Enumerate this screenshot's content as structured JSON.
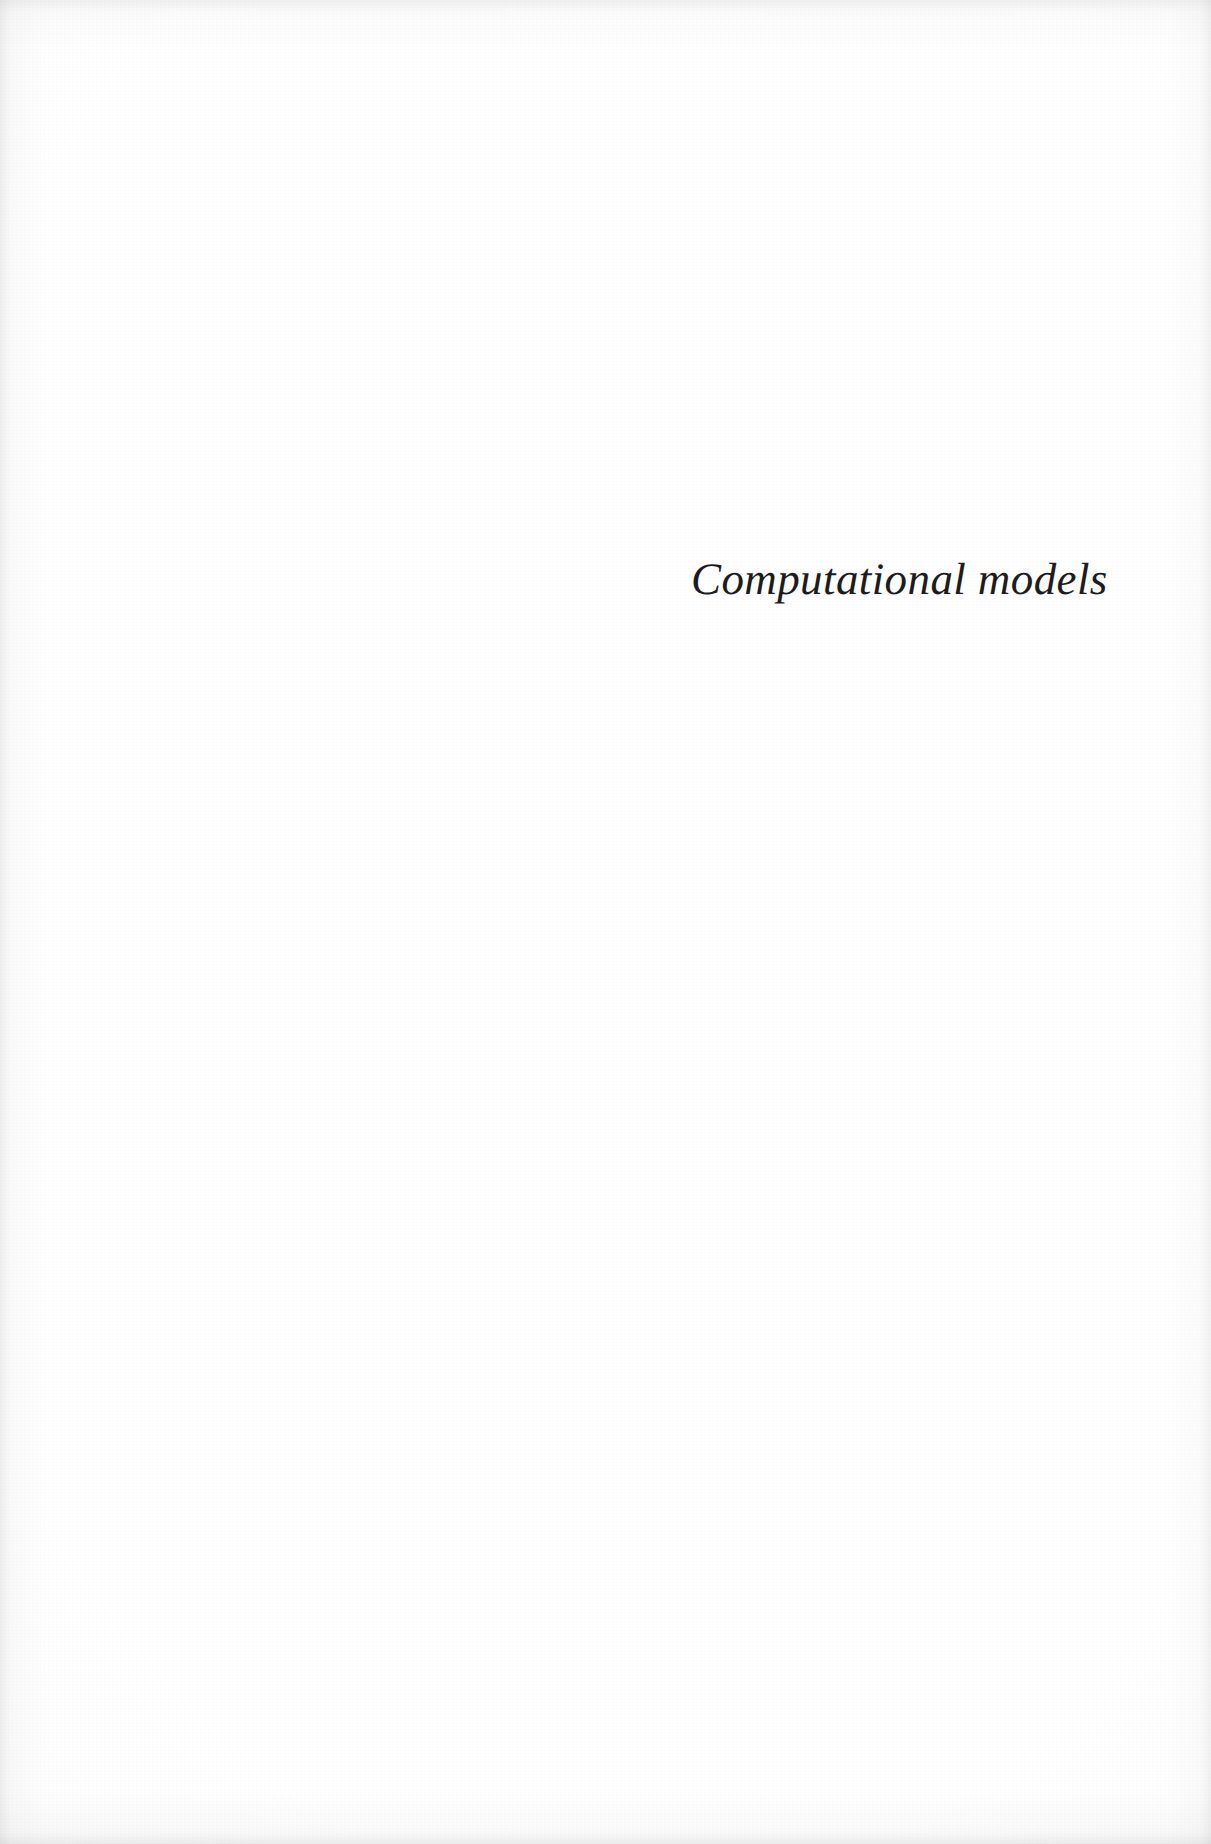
{
  "document": {
    "kind": "scanned-book-page",
    "page_type": "part-divider-page",
    "background_color": "#fdfdfd",
    "text_color": "#1c1c1f"
  },
  "content": {
    "section_title": "Computational models",
    "body_text": "",
    "page_number": "",
    "running_header": "",
    "footnote": ""
  }
}
